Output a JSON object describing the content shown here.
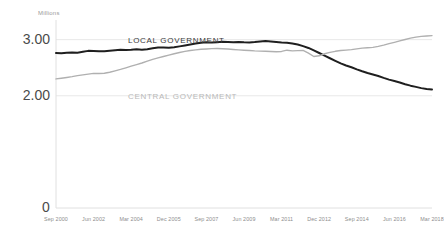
{
  "chart_data": {
    "type": "line",
    "title": "",
    "subtitle": "",
    "xlabel": "",
    "ylabel": "Millions",
    "unit_label": "Millions",
    "ylim": [
      0,
      3.35
    ],
    "xlim": [
      0,
      70
    ],
    "grid": true,
    "gridlines": [
      2.0,
      3.0
    ],
    "y_ticks": [
      "0",
      "2.00",
      "3.00"
    ],
    "y_tick_values": [
      0,
      2.0,
      3.0
    ],
    "legend_position": "inline-annotation",
    "x_tick_labels": [
      "Sep 2000",
      "Jun 2002",
      "Mar 2004",
      "Dec 2005",
      "Sep 2007",
      "Jun 2009",
      "Mar 2011",
      "Dec 2012",
      "Sep 2014",
      "Jun 2016",
      "Mar 2018"
    ],
    "x_tick_indices": [
      0,
      7,
      14,
      21,
      28,
      35,
      42,
      49,
      56,
      63,
      70
    ],
    "x_quarter_count": 71,
    "series": [
      {
        "name": "LOCAL GOVERNMENT",
        "color": "#1f1f1f",
        "label_x": 128,
        "label_y": 36,
        "values": [
          2.762,
          2.757,
          2.766,
          2.772,
          2.768,
          2.783,
          2.8,
          2.797,
          2.792,
          2.795,
          2.803,
          2.812,
          2.818,
          2.815,
          2.82,
          2.828,
          2.822,
          2.83,
          2.845,
          2.858,
          2.862,
          2.856,
          2.866,
          2.88,
          2.896,
          2.912,
          2.93,
          2.944,
          2.952,
          2.948,
          2.955,
          2.962,
          2.958,
          2.955,
          2.96,
          2.952,
          2.948,
          2.956,
          2.968,
          2.974,
          2.966,
          2.958,
          2.95,
          2.944,
          2.93,
          2.912,
          2.884,
          2.852,
          2.808,
          2.762,
          2.714,
          2.668,
          2.622,
          2.578,
          2.54,
          2.508,
          2.47,
          2.436,
          2.406,
          2.38,
          2.352,
          2.318,
          2.288,
          2.262,
          2.236,
          2.206,
          2.18,
          2.158,
          2.136,
          2.122,
          2.112
        ]
      },
      {
        "name": "CENTRAL GOVERNMENT",
        "color": "#b0b0b0",
        "label_x": 128,
        "label_y": 92,
        "values": [
          2.3,
          2.312,
          2.326,
          2.34,
          2.358,
          2.372,
          2.386,
          2.398,
          2.396,
          2.402,
          2.418,
          2.444,
          2.47,
          2.498,
          2.528,
          2.556,
          2.584,
          2.616,
          2.648,
          2.676,
          2.7,
          2.724,
          2.748,
          2.77,
          2.79,
          2.806,
          2.818,
          2.828,
          2.834,
          2.84,
          2.842,
          2.838,
          2.832,
          2.824,
          2.818,
          2.812,
          2.806,
          2.8,
          2.796,
          2.792,
          2.788,
          2.784,
          2.79,
          2.812,
          2.8,
          2.804,
          2.808,
          2.76,
          2.7,
          2.712,
          2.748,
          2.772,
          2.792,
          2.806,
          2.814,
          2.822,
          2.836,
          2.848,
          2.856,
          2.862,
          2.88,
          2.902,
          2.928,
          2.952,
          2.978,
          3.002,
          3.026,
          3.044,
          3.058,
          3.066,
          3.072
        ]
      }
    ]
  },
  "axes": {
    "unit_label": "Millions"
  }
}
